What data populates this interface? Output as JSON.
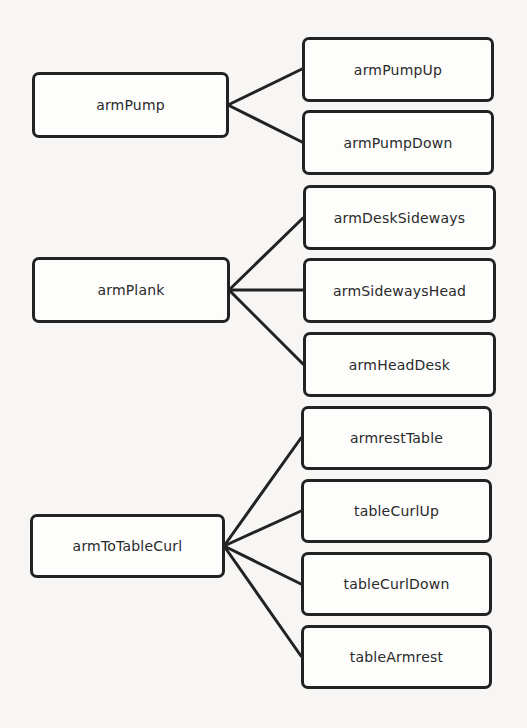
{
  "diagram": {
    "type": "tree",
    "groups": [
      {
        "parent": "armPump",
        "children": [
          "armPumpUp",
          "armPumpDown"
        ]
      },
      {
        "parent": "armPlank",
        "children": [
          "armDeskSideways",
          "armSidewaysHead",
          "armHeadDesk"
        ]
      },
      {
        "parent": "armToTableCurl",
        "children": [
          "armrestTable",
          "tableCurlUp",
          "tableCurlDown",
          "tableArmrest"
        ]
      }
    ],
    "colors": {
      "stroke": "#222222",
      "background": "#f7f6f4",
      "node_fill": "#fdfdfc",
      "text": "#2a2a2a"
    }
  }
}
